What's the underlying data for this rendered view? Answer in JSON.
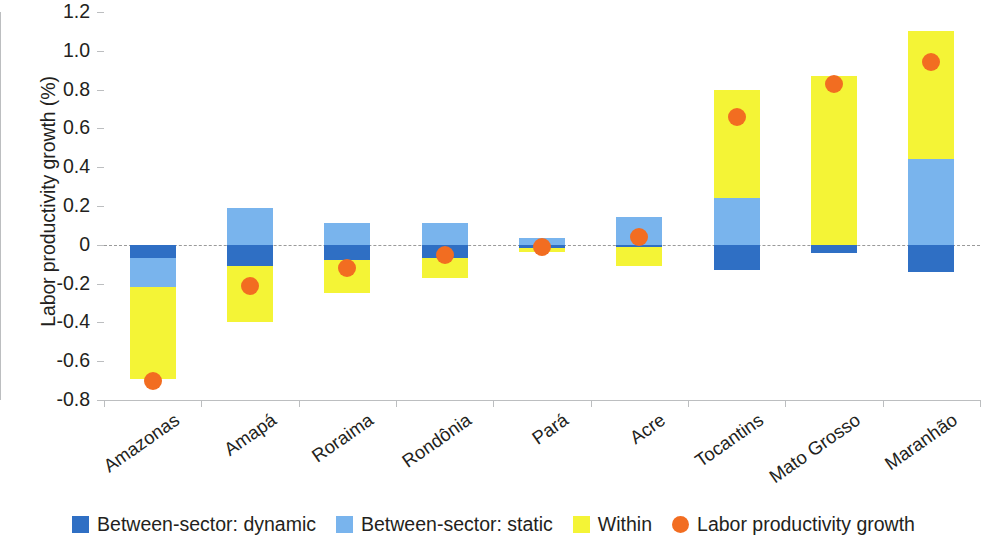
{
  "chart_data": {
    "type": "bar",
    "subtype": "stacked-bar-with-overlay-scatter",
    "title": "",
    "xlabel": "",
    "ylabel": "Labor productivity growth (%)",
    "ylim": [
      -0.8,
      1.2
    ],
    "ytick_labels": [
      "1.2",
      "1.0",
      "0.8",
      "0.6",
      "0.4",
      "0.2",
      "0",
      "-0.2",
      "-0.4",
      "-0.6",
      "-0.8"
    ],
    "ytick_values": [
      1.2,
      1.0,
      0.8,
      0.6,
      0.4,
      0.2,
      0,
      -0.2,
      -0.4,
      -0.6,
      -0.8
    ],
    "grid": false,
    "zero_line": true,
    "legend_position": "bottom",
    "categories": [
      "Amazonas",
      "Amapá",
      "Roraima",
      "Rondônia",
      "Pará",
      "Acre",
      "Tocantins",
      "Mato Grosso",
      "Maranhão"
    ],
    "series": [
      {
        "name": "Between-sector: dynamic",
        "color": "#2f6fc4",
        "values": [
          -0.07,
          -0.11,
          -0.08,
          -0.07,
          -0.015,
          -0.01,
          -0.13,
          -0.04,
          -0.14
        ]
      },
      {
        "name": "Between-sector: static",
        "color": "#79b4ed",
        "values": [
          -0.15,
          0.19,
          0.11,
          0.11,
          0.035,
          0.145,
          0.24,
          0.0,
          0.44
        ]
      },
      {
        "name": "Within",
        "color": "#f4f436",
        "values": [
          -0.47,
          -0.29,
          -0.17,
          -0.1,
          -0.02,
          -0.1,
          0.56,
          0.87,
          0.66
        ]
      }
    ],
    "overlay": {
      "name": "Labor productivity growth",
      "type": "scatter",
      "color": "#f26d21",
      "marker": "circle",
      "values": [
        -0.7,
        -0.21,
        -0.12,
        -0.05,
        -0.01,
        0.04,
        0.66,
        0.83,
        0.94
      ]
    }
  },
  "legend": {
    "items": [
      {
        "label": "Between-sector: dynamic",
        "color": "#2f6fc4",
        "shape": "square",
        "icon": "legend-square-icon"
      },
      {
        "label": "Between-sector: static",
        "color": "#79b4ed",
        "shape": "square",
        "icon": "legend-square-icon"
      },
      {
        "label": "Within",
        "color": "#f4f436",
        "shape": "square",
        "icon": "legend-square-icon"
      },
      {
        "label": "Labor productivity growth",
        "color": "#f26d21",
        "shape": "circle",
        "icon": "legend-circle-icon"
      }
    ]
  }
}
